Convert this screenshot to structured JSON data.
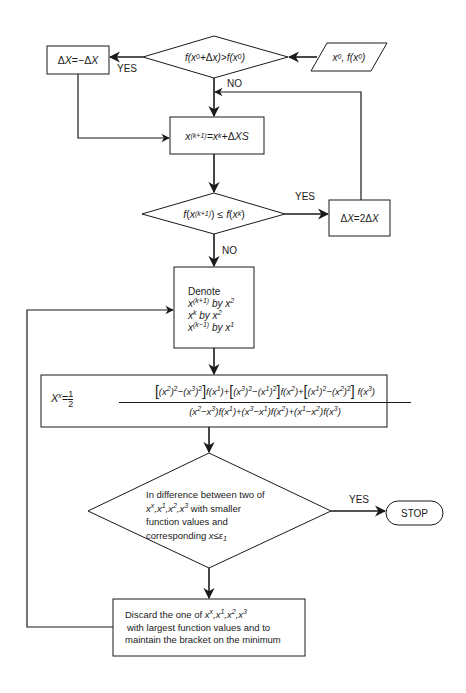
{
  "diagram": {
    "stroke_color": "#1a1a1a",
    "background": "#ffffff"
  },
  "nodes": {
    "input": {
      "type": "parallelogram",
      "label": "x⁰, f(x⁰)",
      "base": "x",
      "sup1": "0",
      "sep": ", f(x",
      "sup2": "0",
      "close": ")"
    },
    "decision1": {
      "type": "diamond",
      "label": "f(x⁰+Δx)>f(x⁰)"
    },
    "negate_step": {
      "type": "process",
      "label": "ΔX=−ΔX"
    },
    "update_x": {
      "type": "process",
      "label": "x^(k+1)=x^k+ΔXS"
    },
    "decision2": {
      "type": "diamond",
      "label": "f(x^(k+1)) ≤ f(x^k)"
    },
    "double_step": {
      "type": "process",
      "label": "ΔX=2ΔX"
    },
    "denote": {
      "type": "process",
      "title": "Denote",
      "lines": [
        "x^(k+1) by x²",
        "x^k by x²",
        "x^(k−1) by x¹"
      ]
    },
    "formula": {
      "type": "process",
      "lhs": "X^x = 1/2",
      "numerator": "[(x²)²−(x³)²] f(x¹) + [(x³)²−(x¹)²] f(x²) + [(x¹)²−(x²)²] f(x³)",
      "denominator": "(x²−x³)f(x¹) + (x³−x¹)f(x²) + (x¹−x²)f(x³)"
    },
    "decision3": {
      "type": "diamond",
      "lines": [
        "In difference between two of",
        "x^x, x¹, x², x³ with smaller",
        "function values and",
        "corresponding x≤ε₁"
      ]
    },
    "stop": {
      "type": "terminal",
      "label": "STOP"
    },
    "discard": {
      "type": "process",
      "lines": [
        "Discard the one of x^x, x¹, x², x³",
        "with largest function values and to",
        "maintain the bracket on the minimum"
      ]
    }
  },
  "edges": [
    {
      "from": "input",
      "to": "decision1",
      "label": ""
    },
    {
      "from": "decision1",
      "to": "negate_step",
      "label": "YES"
    },
    {
      "from": "decision1",
      "to": "update_x",
      "label": "NO"
    },
    {
      "from": "negate_step",
      "to": "update_x",
      "label": ""
    },
    {
      "from": "update_x",
      "to": "decision2",
      "label": ""
    },
    {
      "from": "decision2",
      "to": "double_step",
      "label": "YES"
    },
    {
      "from": "double_step",
      "to": "update_x",
      "label": ""
    },
    {
      "from": "decision2",
      "to": "denote",
      "label": "NO"
    },
    {
      "from": "denote",
      "to": "formula",
      "label": ""
    },
    {
      "from": "formula",
      "to": "decision3",
      "label": ""
    },
    {
      "from": "decision3",
      "to": "stop",
      "label": "YES"
    },
    {
      "from": "decision3",
      "to": "discard",
      "label": ""
    },
    {
      "from": "discard",
      "to": "denote",
      "label": ""
    }
  ],
  "labels": {
    "yes": "YES",
    "no": "NO",
    "denote_title": "Denote",
    "by": "by",
    "stop": "STOP",
    "d3_line1": "In difference between two of",
    "d3_line2_tail": " with smaller",
    "d3_line3": "function values and",
    "d3_line4_head": "corresponding ",
    "discard_line1_head": "Discard the one of ",
    "discard_line2": "with largest function values and to",
    "discard_line3": "maintain the bracket on the minimum"
  }
}
